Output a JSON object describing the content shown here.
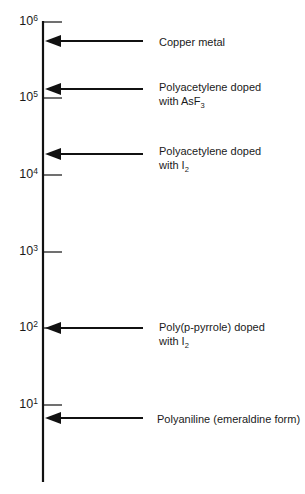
{
  "chart_data": {
    "type": "scale-diagram",
    "axis": {
      "scale": "log",
      "range": [
        1,
        1000000
      ],
      "ticks": [
        {
          "base": "10",
          "exp": "6",
          "y": 22
        },
        {
          "base": "10",
          "exp": "5",
          "y": 98
        },
        {
          "base": "10",
          "exp": "4",
          "y": 175
        },
        {
          "base": "10",
          "exp": "3",
          "y": 252
        },
        {
          "base": "10",
          "exp": "2",
          "y": 328
        },
        {
          "base": "10",
          "exp": "1",
          "y": 405
        }
      ]
    },
    "markers": [
      {
        "line1": "Copper metal",
        "line2": "",
        "sub": "",
        "y": 41,
        "label_y": 35
      },
      {
        "line1": "Polyacetylene doped",
        "line2": "with AsF",
        "sub": "3",
        "y": 89,
        "label_y": 80
      },
      {
        "line1": "Polyacetylene doped",
        "line2": "with I",
        "sub": "2",
        "y": 154,
        "label_y": 144
      },
      {
        "line1": "Poly(p-pyrrole) doped",
        "line2": "with I",
        "sub": "2",
        "y": 328,
        "label_y": 320
      },
      {
        "line1": "Polyaniline (emeraldine form)",
        "line2": "",
        "sub": "",
        "y": 418,
        "label_y": 412
      }
    ]
  },
  "colors": {
    "ink": "#111111",
    "background": "#ffffff"
  }
}
